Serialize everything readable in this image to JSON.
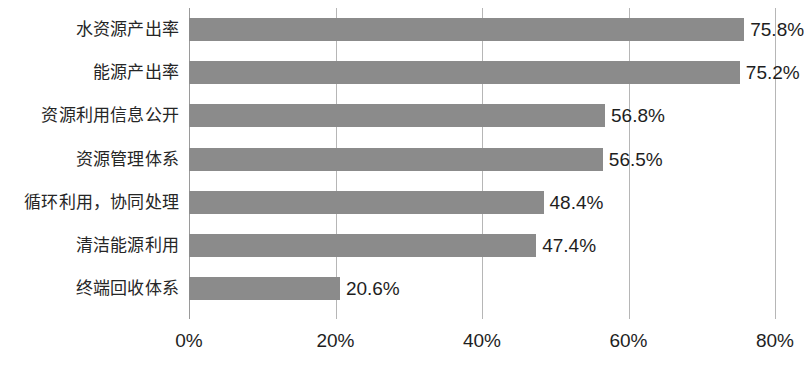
{
  "chart_data": {
    "type": "bar",
    "orientation": "horizontal",
    "title": "",
    "subtitle": "",
    "xlabel": "",
    "ylabel": "",
    "xlim": [
      0,
      80
    ],
    "ylim": null,
    "grid": true,
    "legend": false,
    "legend_position": "none",
    "bar_color": "#8b8b8b",
    "gridline_color": "#b6b6b6",
    "axis_color": "#9a9a9a",
    "text_color": "#1e1e1e",
    "background_color": "#ffffff",
    "value_suffix": "%",
    "categories": [
      "水资源产出率",
      "能源产出率",
      "资源利用信息公开",
      "资源管理体系",
      "循环利用，协同处理",
      "清洁能源利用",
      "终端回收体系"
    ],
    "values": [
      75.8,
      75.2,
      56.8,
      56.5,
      48.4,
      47.4,
      20.6
    ],
    "data_labels": [
      "75.8%",
      "75.2%",
      "56.8%",
      "56.5%",
      "48.4%",
      "47.4%",
      "20.6%"
    ],
    "xticks": [
      0,
      20,
      40,
      60,
      80
    ],
    "xticklabels": [
      "0%",
      "20%",
      "40%",
      "60%",
      "80%"
    ]
  }
}
